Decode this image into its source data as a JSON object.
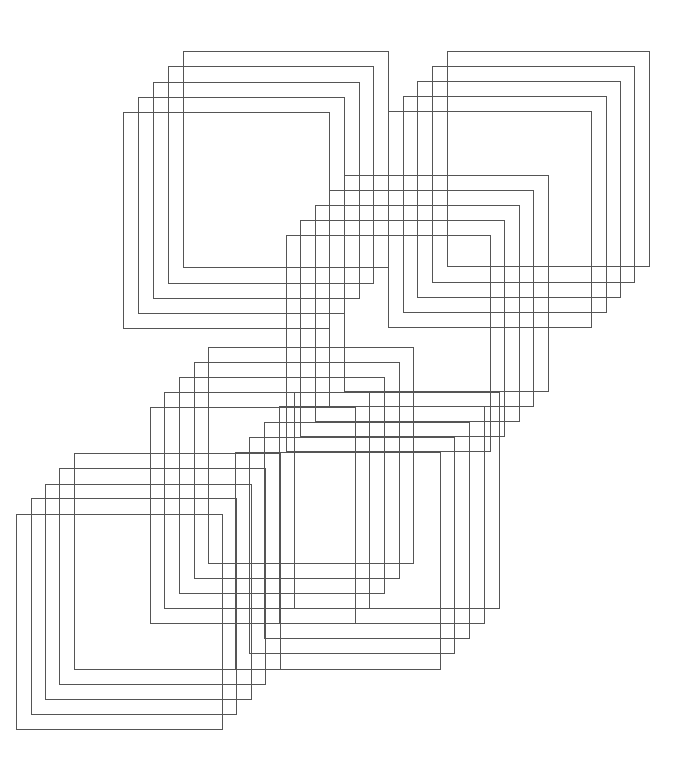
{
  "canvas": {
    "width": 693,
    "height": 764,
    "background": "#ffffff"
  },
  "style": {
    "stroke": "#555555",
    "stroke_width": 1.1
  },
  "groups": [
    {
      "name": "top-left-group",
      "squares": [
        {
          "x": 183,
          "y": 51,
          "w": 205,
          "h": 216
        },
        {
          "x": 168,
          "y": 66,
          "w": 205,
          "h": 217
        },
        {
          "x": 153,
          "y": 82,
          "w": 206,
          "h": 216
        },
        {
          "x": 138,
          "y": 97,
          "w": 206,
          "h": 216
        },
        {
          "x": 123,
          "y": 112,
          "w": 206,
          "h": 216
        }
      ]
    },
    {
      "name": "top-right-group",
      "squares": [
        {
          "x": 447,
          "y": 51,
          "w": 202,
          "h": 215
        },
        {
          "x": 432,
          "y": 66,
          "w": 202,
          "h": 216
        },
        {
          "x": 417,
          "y": 81,
          "w": 203,
          "h": 216
        },
        {
          "x": 403,
          "y": 96,
          "w": 203,
          "h": 216
        },
        {
          "x": 388,
          "y": 111,
          "w": 203,
          "h": 216
        }
      ]
    },
    {
      "name": "middle-group",
      "squares": [
        {
          "x": 344,
          "y": 175,
          "w": 204,
          "h": 216
        },
        {
          "x": 329,
          "y": 190,
          "w": 204,
          "h": 216
        },
        {
          "x": 315,
          "y": 205,
          "w": 204,
          "h": 216
        },
        {
          "x": 300,
          "y": 220,
          "w": 204,
          "h": 216
        },
        {
          "x": 286,
          "y": 235,
          "w": 204,
          "h": 216
        }
      ]
    },
    {
      "name": "lower-middle-group",
      "squares": [
        {
          "x": 208,
          "y": 347,
          "w": 205,
          "h": 216
        },
        {
          "x": 194,
          "y": 362,
          "w": 205,
          "h": 216
        },
        {
          "x": 179,
          "y": 377,
          "w": 205,
          "h": 216
        },
        {
          "x": 164,
          "y": 392,
          "w": 205,
          "h": 216
        },
        {
          "x": 150,
          "y": 407,
          "w": 205,
          "h": 216
        }
      ]
    },
    {
      "name": "lower-right-group",
      "squares": [
        {
          "x": 294,
          "y": 392,
          "w": 205,
          "h": 216
        },
        {
          "x": 279,
          "y": 406,
          "w": 205,
          "h": 217
        },
        {
          "x": 264,
          "y": 422,
          "w": 205,
          "h": 216
        },
        {
          "x": 249,
          "y": 437,
          "w": 205,
          "h": 216
        },
        {
          "x": 235,
          "y": 452,
          "w": 205,
          "h": 217
        }
      ]
    },
    {
      "name": "bottom-left-group",
      "squares": [
        {
          "x": 74,
          "y": 453,
          "w": 206,
          "h": 216
        },
        {
          "x": 59,
          "y": 468,
          "w": 206,
          "h": 216
        },
        {
          "x": 45,
          "y": 484,
          "w": 206,
          "h": 215
        },
        {
          "x": 31,
          "y": 498,
          "w": 205,
          "h": 216
        },
        {
          "x": 16,
          "y": 514,
          "w": 206,
          "h": 215
        }
      ]
    }
  ]
}
